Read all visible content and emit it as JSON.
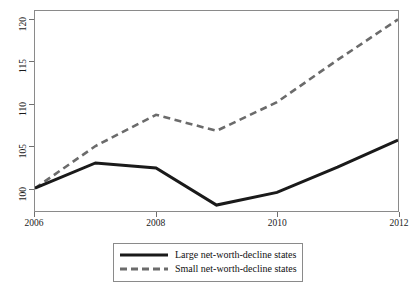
{
  "chart_data": {
    "type": "line",
    "title": "",
    "subtitle": "",
    "xlabel": "",
    "ylabel": "",
    "x": [
      2006,
      2007,
      2008,
      2009,
      2010,
      2011,
      2012
    ],
    "xlim": [
      2006,
      2012
    ],
    "ylim": [
      97.3,
      121.0
    ],
    "grid": false,
    "legend_position": "bottom-center",
    "xticks": [
      {
        "value": 2006,
        "label": "2006"
      },
      {
        "value": 2008,
        "label": "2008"
      },
      {
        "value": 2010,
        "label": "2010"
      },
      {
        "value": 2012,
        "label": "2012"
      }
    ],
    "yticks": [
      {
        "value": 100,
        "label": "100"
      },
      {
        "value": 105,
        "label": "105"
      },
      {
        "value": 110,
        "label": "110"
      },
      {
        "value": 115,
        "label": "115"
      },
      {
        "value": 120,
        "label": "120"
      }
    ],
    "series": [
      {
        "name": "Large net-worth-decline states",
        "style": "solid",
        "color": "#1a1a1a",
        "width": 3.0,
        "values": [
          100.0,
          103.0,
          102.4,
          98.0,
          99.5,
          102.5,
          105.7
        ]
      },
      {
        "name": "Small net-worth-decline states",
        "style": "dashed",
        "color": "#6b6b6b",
        "width": 2.6,
        "values": [
          100.0,
          105.0,
          108.7,
          106.8,
          110.2,
          115.2,
          120.0
        ]
      }
    ]
  },
  "legend": {
    "entries": [
      {
        "label": "Large net-worth-decline states",
        "swatch": "solid-line-swatch"
      },
      {
        "label": "Small net-worth-decline states",
        "swatch": "dashed-line-swatch"
      }
    ]
  }
}
